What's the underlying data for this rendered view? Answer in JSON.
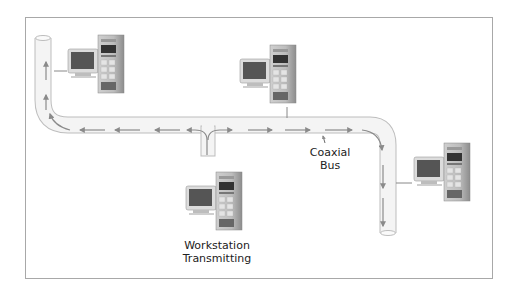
{
  "diagram": {
    "labels": {
      "bus": [
        "Coaxial",
        "Bus"
      ],
      "transmitter": [
        "Workstation",
        "Transmitting"
      ]
    },
    "nodes": [
      {
        "id": "ws-top-left",
        "role": "workstation"
      },
      {
        "id": "ws-top-center",
        "role": "workstation"
      },
      {
        "id": "ws-right",
        "role": "workstation"
      },
      {
        "id": "ws-transmitting",
        "role": "transmitting workstation"
      }
    ],
    "colors": {
      "frame": "#a8a8a8",
      "cable_fill": "#f3f3f3",
      "cable_edge": "#bdbdbd",
      "arrow": "#8a8a8a",
      "text": "#222222"
    }
  }
}
